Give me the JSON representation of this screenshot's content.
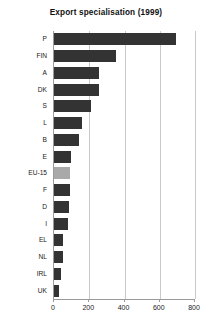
{
  "chart_data": {
    "type": "bar",
    "orientation": "horizontal",
    "title": "Export specialisation (1999)",
    "xlabel": "",
    "ylabel": "",
    "xlim": [
      0,
      800
    ],
    "xticks": [
      0,
      200,
      400,
      600,
      800
    ],
    "xtick_labels": [
      "0",
      "200",
      "400",
      "600",
      "800"
    ],
    "grid": true,
    "grid_axis": "x",
    "legend": "none",
    "categories": [
      "P",
      "FIN",
      "A",
      "DK",
      "S",
      "L",
      "B",
      "E",
      "EU-15",
      "F",
      "D",
      "I",
      "EL",
      "NL",
      "IRL",
      "UK"
    ],
    "values": [
      693,
      349,
      258,
      256,
      212,
      160,
      143,
      98,
      93,
      88,
      86,
      80,
      52,
      50,
      41,
      30
    ],
    "bar_colors": [
      "#333333",
      "#333333",
      "#333333",
      "#333333",
      "#333333",
      "#333333",
      "#333333",
      "#333333",
      "#a9a9a9",
      "#333333",
      "#333333",
      "#333333",
      "#333333",
      "#333333",
      "#333333",
      "#333333"
    ],
    "highlight_category": "EU-15",
    "colors": {
      "bar": "#333333",
      "bar_highlight": "#a9a9a9",
      "gridline": "#c9c9c9",
      "axis": "#9a9a9a",
      "background": "#ffffff",
      "text": "#1a1a1a"
    }
  }
}
